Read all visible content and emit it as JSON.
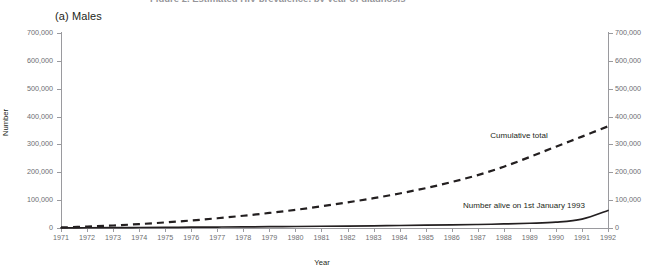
{
  "figure": {
    "clipped_header": "Figure 2. Estimated HIV prevalence, by year of diagnosis",
    "panel_title": "(a) Males"
  },
  "chart_data": {
    "type": "line",
    "title": "(a) Males",
    "xlabel": "Year",
    "ylabel": "Number",
    "xlim": [
      1971,
      1992
    ],
    "ylim": [
      0,
      700000
    ],
    "grid": false,
    "legend_position": "inline-annotations",
    "y_ticks": [
      0,
      100000,
      200000,
      300000,
      400000,
      500000,
      600000,
      700000
    ],
    "y_tick_labels": [
      "0",
      "100,000",
      "200,000",
      "300,000",
      "400,000",
      "500,000",
      "600,000",
      "700,000"
    ],
    "right_axis": {
      "ylim": [
        0,
        700000
      ],
      "y_tick_labels": [
        "0",
        "100,000",
        "200,000",
        "300,000",
        "400,000",
        "500,000",
        "600,000",
        "700,000"
      ]
    },
    "x": [
      1971,
      1972,
      1973,
      1974,
      1975,
      1976,
      1977,
      1978,
      1979,
      1980,
      1981,
      1982,
      1983,
      1984,
      1985,
      1986,
      1987,
      1988,
      1989,
      1990,
      1991,
      1992
    ],
    "x_tick_labels": [
      "1971",
      "1972",
      "1973",
      "1974",
      "1975",
      "1976",
      "1977",
      "1978",
      "1979",
      "1980",
      "1981",
      "1982",
      "1983",
      "1984",
      "1985",
      "1986",
      "1987",
      "1988",
      "1989",
      "1990",
      "1991",
      "1992"
    ],
    "series": [
      {
        "name": "Cumulative total",
        "style": "dashed",
        "color": "#231f20",
        "values": [
          2000,
          5000,
          9000,
          14000,
          20000,
          27000,
          35000,
          44000,
          54000,
          65000,
          78000,
          92000,
          107000,
          124000,
          143000,
          165000,
          190000,
          220000,
          255000,
          292000,
          328000,
          365000
        ]
      },
      {
        "name": "Number alive on 1st January 1993",
        "style": "solid",
        "color": "#231f20",
        "values": [
          500,
          900,
          1300,
          1800,
          2300,
          2800,
          3400,
          4000,
          4700,
          5400,
          6200,
          7000,
          7900,
          8900,
          10000,
          11200,
          12600,
          14500,
          17000,
          21000,
          32000,
          63000
        ]
      }
    ],
    "annotations": [
      {
        "text": "Cumulative total",
        "x": 1988.6,
        "y": 395000
      },
      {
        "text": "Number alive on 1st January 1993",
        "x": 1989.0,
        "y": 105000
      }
    ]
  }
}
